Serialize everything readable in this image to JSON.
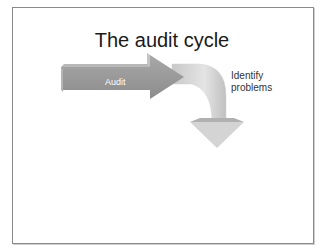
{
  "slide": {
    "title": "The audit cycle",
    "steps": [
      {
        "label": "Audit",
        "shape": "straight-arrow-right"
      },
      {
        "label": "Identify\nproblems",
        "shape": "curved-arrow-down"
      }
    ]
  },
  "colors": {
    "straight_arrow": "#9a9a9a",
    "curved_arrow": "#d8d8d8",
    "frame": "#8a8a8a",
    "title_text": "#1a1a1a"
  }
}
